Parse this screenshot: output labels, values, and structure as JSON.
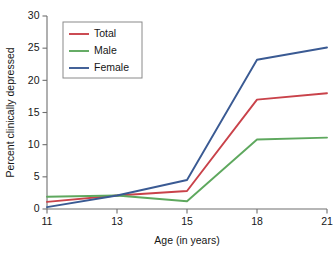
{
  "chart_data": {
    "type": "line",
    "title": "",
    "xlabel": "Age (in years)",
    "ylabel": "Percent clinically depressed",
    "categories": [
      "11",
      "13",
      "15",
      "18",
      "21"
    ],
    "x": [
      11,
      13,
      15,
      18,
      21
    ],
    "ylim": [
      0,
      30
    ],
    "yticks": [
      0,
      5,
      10,
      15,
      20,
      25,
      30
    ],
    "xticks": [
      "11",
      "13",
      "15",
      "18",
      "21"
    ],
    "grid": false,
    "legend_position": "upper-left",
    "series": [
      {
        "name": "Total",
        "color": "#c9424a",
        "values": [
          1.1,
          2.1,
          2.8,
          17.0,
          18.0
        ]
      },
      {
        "name": "Male",
        "color": "#5ea85e",
        "values": [
          1.9,
          2.1,
          1.2,
          10.8,
          11.1
        ]
      },
      {
        "name": "Female",
        "color": "#3a5a93",
        "values": [
          0.3,
          2.1,
          4.5,
          23.2,
          25.1
        ]
      }
    ]
  }
}
